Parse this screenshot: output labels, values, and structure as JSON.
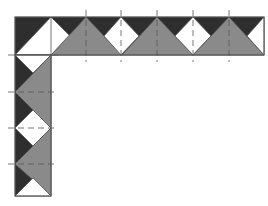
{
  "diagram": {
    "type": "quilt-border-corner",
    "colors": {
      "dark": "#2e2e2e",
      "medium": "#8a8a8a",
      "light": "#ffffff",
      "outline": "#555555",
      "guide": "#555555"
    },
    "top_band": {
      "x0": 15,
      "x1": 264,
      "y0": 17,
      "y1": 55,
      "unit": 35.8
    },
    "left_column": {
      "x0": 15,
      "x1": 51,
      "y0": 55,
      "y1": 196,
      "unit": 36
    },
    "vertical_guides_x": [
      86,
      121,
      157,
      193,
      229
    ],
    "horizontal_guides_y": [
      92,
      128,
      164
    ]
  }
}
